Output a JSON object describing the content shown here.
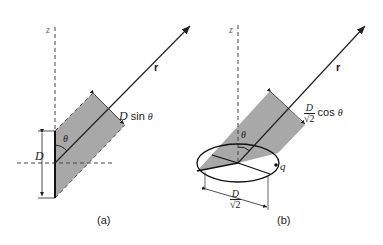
{
  "figure": {
    "panels": [
      {
        "id": "a",
        "caption": "(a)",
        "axis_label": "z",
        "vector_label": "r",
        "angle_label": "θ",
        "length_label": "D",
        "projection_label": {
          "symbol": "D",
          "func": " sin ",
          "var": "θ"
        }
      },
      {
        "id": "b",
        "caption": "(b)",
        "axis_label": "z",
        "vector_label": "r",
        "angle_label": "θ",
        "charge_label": "q",
        "radius_label": {
          "num": "D",
          "den": "√2"
        },
        "projection_label": {
          "num": "D",
          "den": "√2",
          "func": " cos ",
          "var": "θ"
        }
      }
    ],
    "colors": {
      "shade": "#a8a8a8",
      "line": "#222222"
    }
  }
}
